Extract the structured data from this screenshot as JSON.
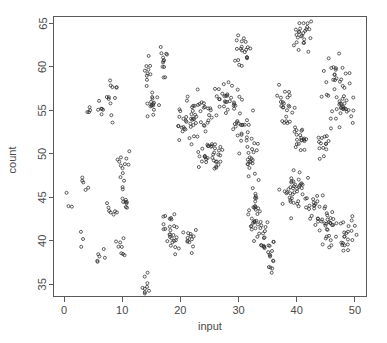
{
  "chart_data": {
    "type": "scatter",
    "title": "",
    "xlabel": "input",
    "ylabel": "count",
    "xlim": [
      -1.8,
      52.0
    ],
    "ylim": [
      33.6,
      65.8
    ],
    "xticks": [
      0,
      10,
      20,
      30,
      40,
      50
    ],
    "yticks": [
      35,
      40,
      45,
      50,
      55,
      60,
      65
    ],
    "grid": false,
    "legend": null,
    "marker": "open-circle",
    "marker_color": "#2b2b2b",
    "marker_size": 3,
    "frame": "box",
    "clusters": [
      {
        "cx": 0.2,
        "cy": 45.6,
        "n": 1,
        "sx": 0.15,
        "sy": 0.15
      },
      {
        "cx": 1.1,
        "cy": 44.0,
        "n": 2,
        "sx": 0.25,
        "sy": 0.25
      },
      {
        "cx": 3.0,
        "cy": 41.0,
        "n": 1,
        "sx": 0.15,
        "sy": 0.15
      },
      {
        "cx": 3.2,
        "cy": 46.6,
        "n": 3,
        "sx": 0.3,
        "sy": 0.4
      },
      {
        "cx": 3.5,
        "cy": 40.1,
        "n": 1,
        "sx": 0.15,
        "sy": 0.15
      },
      {
        "cx": 3.0,
        "cy": 38.9,
        "n": 1,
        "sx": 0.15,
        "sy": 0.15
      },
      {
        "cx": 4.0,
        "cy": 45.5,
        "n": 2,
        "sx": 0.25,
        "sy": 0.3
      },
      {
        "cx": 4.2,
        "cy": 54.7,
        "n": 4,
        "sx": 0.25,
        "sy": 0.45
      },
      {
        "cx": 6.0,
        "cy": 37.7,
        "n": 4,
        "sx": 0.25,
        "sy": 0.45
      },
      {
        "cx": 6.4,
        "cy": 55.6,
        "n": 5,
        "sx": 0.35,
        "sy": 0.6
      },
      {
        "cx": 7.0,
        "cy": 38.8,
        "n": 2,
        "sx": 0.2,
        "sy": 0.3
      },
      {
        "cx": 7.6,
        "cy": 56.2,
        "n": 6,
        "sx": 0.4,
        "sy": 0.7
      },
      {
        "cx": 7.8,
        "cy": 44.2,
        "n": 4,
        "sx": 0.35,
        "sy": 0.6
      },
      {
        "cx": 8.1,
        "cy": 57.7,
        "n": 3,
        "sx": 0.25,
        "sy": 0.4
      },
      {
        "cx": 8.4,
        "cy": 53.9,
        "n": 2,
        "sx": 0.2,
        "sy": 0.3
      },
      {
        "cx": 8.7,
        "cy": 43.3,
        "n": 3,
        "sx": 0.3,
        "sy": 0.45
      },
      {
        "cx": 9.1,
        "cy": 57.8,
        "n": 2,
        "sx": 0.2,
        "sy": 0.3
      },
      {
        "cx": 9.5,
        "cy": 39.9,
        "n": 4,
        "sx": 0.3,
        "sy": 0.5
      },
      {
        "cx": 9.7,
        "cy": 49.3,
        "n": 6,
        "sx": 0.4,
        "sy": 0.7
      },
      {
        "cx": 10.0,
        "cy": 38.6,
        "n": 4,
        "sx": 0.3,
        "sy": 0.5
      },
      {
        "cx": 10.3,
        "cy": 46.4,
        "n": 7,
        "sx": 0.4,
        "sy": 0.8
      },
      {
        "cx": 10.6,
        "cy": 44.6,
        "n": 6,
        "sx": 0.4,
        "sy": 0.8
      },
      {
        "cx": 11.0,
        "cy": 49.7,
        "n": 3,
        "sx": 0.25,
        "sy": 0.4
      },
      {
        "cx": 13.8,
        "cy": 35.0,
        "n": 10,
        "sx": 0.5,
        "sy": 0.8
      },
      {
        "cx": 14.4,
        "cy": 60.2,
        "n": 10,
        "sx": 0.45,
        "sy": 0.9
      },
      {
        "cx": 15.2,
        "cy": 55.7,
        "n": 16,
        "sx": 0.6,
        "sy": 0.9
      },
      {
        "cx": 17.0,
        "cy": 60.4,
        "n": 12,
        "sx": 0.5,
        "sy": 0.9
      },
      {
        "cx": 17.2,
        "cy": 41.9,
        "n": 4,
        "sx": 0.3,
        "sy": 0.5
      },
      {
        "cx": 18.3,
        "cy": 41.4,
        "n": 14,
        "sx": 0.6,
        "sy": 1.0
      },
      {
        "cx": 19.2,
        "cy": 39.7,
        "n": 10,
        "sx": 0.5,
        "sy": 0.8
      },
      {
        "cx": 20.6,
        "cy": 53.3,
        "n": 18,
        "sx": 0.6,
        "sy": 1.1
      },
      {
        "cx": 21.6,
        "cy": 40.1,
        "n": 12,
        "sx": 0.5,
        "sy": 0.9
      },
      {
        "cx": 22.0,
        "cy": 54.6,
        "n": 20,
        "sx": 0.7,
        "sy": 1.3
      },
      {
        "cx": 24.2,
        "cy": 54.6,
        "n": 16,
        "sx": 0.6,
        "sy": 1.1
      },
      {
        "cx": 24.5,
        "cy": 50.1,
        "n": 22,
        "sx": 0.8,
        "sy": 1.1
      },
      {
        "cx": 26.4,
        "cy": 49.3,
        "n": 14,
        "sx": 0.6,
        "sy": 0.9
      },
      {
        "cx": 27.6,
        "cy": 56.3,
        "n": 22,
        "sx": 0.8,
        "sy": 1.2
      },
      {
        "cx": 29.4,
        "cy": 55.1,
        "n": 16,
        "sx": 0.7,
        "sy": 1.0
      },
      {
        "cx": 30.8,
        "cy": 62.0,
        "n": 20,
        "sx": 0.7,
        "sy": 1.2
      },
      {
        "cx": 31.4,
        "cy": 52.7,
        "n": 18,
        "sx": 0.7,
        "sy": 1.2
      },
      {
        "cx": 32.2,
        "cy": 48.8,
        "n": 18,
        "sx": 0.7,
        "sy": 1.2
      },
      {
        "cx": 32.8,
        "cy": 43.5,
        "n": 22,
        "sx": 0.8,
        "sy": 1.3
      },
      {
        "cx": 34.0,
        "cy": 40.9,
        "n": 22,
        "sx": 0.8,
        "sy": 1.3
      },
      {
        "cx": 35.6,
        "cy": 38.5,
        "n": 16,
        "sx": 0.6,
        "sy": 1.0
      },
      {
        "cx": 38.2,
        "cy": 55.6,
        "n": 24,
        "sx": 0.9,
        "sy": 1.2
      },
      {
        "cx": 38.6,
        "cy": 45.1,
        "n": 20,
        "sx": 0.8,
        "sy": 1.2
      },
      {
        "cx": 40.2,
        "cy": 46.3,
        "n": 22,
        "sx": 0.8,
        "sy": 1.2
      },
      {
        "cx": 40.6,
        "cy": 51.9,
        "n": 20,
        "sx": 0.7,
        "sy": 1.2
      },
      {
        "cx": 41.2,
        "cy": 63.9,
        "n": 26,
        "sx": 0.9,
        "sy": 1.3
      },
      {
        "cx": 43.5,
        "cy": 43.3,
        "n": 22,
        "sx": 0.8,
        "sy": 1.2
      },
      {
        "cx": 44.4,
        "cy": 51.2,
        "n": 16,
        "sx": 0.6,
        "sy": 1.0
      },
      {
        "cx": 45.3,
        "cy": 41.4,
        "n": 26,
        "sx": 0.9,
        "sy": 1.2
      },
      {
        "cx": 46.2,
        "cy": 59.0,
        "n": 22,
        "sx": 0.8,
        "sy": 1.2
      },
      {
        "cx": 48.3,
        "cy": 55.9,
        "n": 30,
        "sx": 1.0,
        "sy": 1.4
      },
      {
        "cx": 48.8,
        "cy": 40.8,
        "n": 22,
        "sx": 0.8,
        "sy": 1.1
      }
    ]
  },
  "axes": {
    "x_tick_labels": [
      "0",
      "10",
      "20",
      "30",
      "40",
      "50"
    ],
    "y_tick_labels": [
      "35",
      "40",
      "45",
      "50",
      "55",
      "60",
      "65"
    ],
    "x_title": "input",
    "y_title": "count"
  },
  "colors": {
    "background": "#ffffff",
    "frame": "#5a5a5a",
    "text": "#4a4a4a",
    "marker_stroke": "#2b2b2b"
  }
}
